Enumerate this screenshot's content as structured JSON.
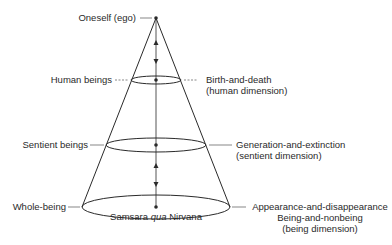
{
  "labels": {
    "apex": "Oneself (ego)",
    "human_left": "Human beings",
    "sentient_left": "Sentient beings",
    "whole_left": "Whole-being",
    "human_right_1": "Birth-and-death",
    "human_right_2": "(human dimension)",
    "sentient_right_1": "Generation-and-extinction",
    "sentient_right_2": "(sentient dimension)",
    "base_right_1": "Appearance-and-disappearance",
    "base_right_2": "Being-and-nonbeing",
    "base_right_3": "(being dimension)",
    "base_center_a": "Samsara",
    "base_center_qua": "qua",
    "base_center_b": "Nirvana"
  },
  "colors": {
    "line": "#2a2a2a",
    "leader": "#555555",
    "text": "#2a2a2a"
  }
}
